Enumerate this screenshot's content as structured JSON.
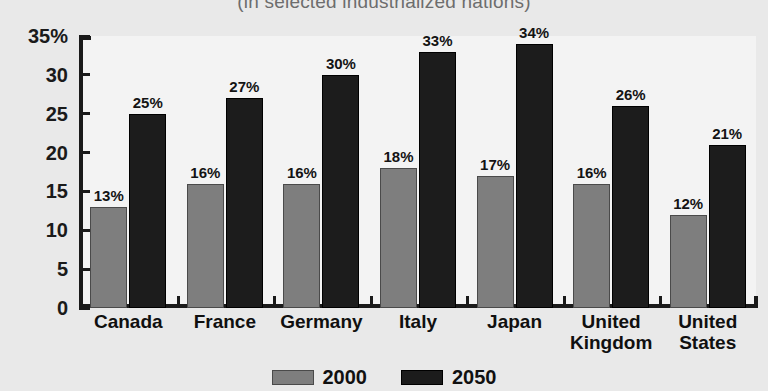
{
  "chart_data": {
    "type": "bar",
    "title": "",
    "subtitle": "(in selected industrialized nations)",
    "xlabel": "",
    "ylabel": "",
    "ylim": [
      0,
      35
    ],
    "yticks": [
      0,
      5,
      10,
      15,
      20,
      25,
      30,
      35
    ],
    "ytick_labels": [
      "0",
      "5",
      "10",
      "15",
      "20",
      "25",
      "30",
      "35%"
    ],
    "grid": false,
    "legend_position": "bottom-center",
    "categories": [
      "Canada",
      "France",
      "Germany",
      "Italy",
      "Japan",
      "United\nKingdom",
      "United\nStates"
    ],
    "series": [
      {
        "name": "2000",
        "color": "#7e7e7e",
        "values": [
          13,
          16,
          16,
          18,
          17,
          16,
          12
        ],
        "labels": [
          "13%",
          "16%",
          "16%",
          "18%",
          "17%",
          "16%",
          "12%"
        ]
      },
      {
        "name": "2050",
        "color": "#1c1c1c",
        "values": [
          25,
          27,
          30,
          33,
          34,
          26,
          21
        ],
        "labels": [
          "25%",
          "27%",
          "30%",
          "33%",
          "34%",
          "26%",
          "21%"
        ]
      }
    ]
  },
  "legend": {
    "entries": [
      {
        "label": "2000",
        "swatch": "gray-swatch-icon"
      },
      {
        "label": "2050",
        "swatch": "black-swatch-icon"
      }
    ]
  }
}
